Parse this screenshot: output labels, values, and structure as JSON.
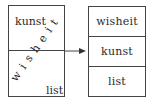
{
  "left_panel": {
    "top_label": "kunst",
    "bottom_label": "list",
    "diagonal_word": "wisheit"
  },
  "right_panel": {
    "rows": [
      {
        "label": "wisheit"
      },
      {
        "label": "kunst"
      },
      {
        "label": "list"
      }
    ]
  },
  "arrow": {
    "direction": "right",
    "icon": "arrow-right-icon"
  },
  "colors": {
    "stroke": "#444444",
    "text": "#2a2a2a",
    "background": "#ffffff"
  }
}
